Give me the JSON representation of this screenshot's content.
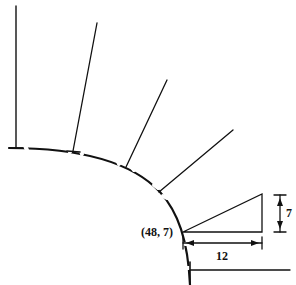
{
  "diagram": {
    "point_label": "(48, 7)",
    "horizontal_dimension": "12",
    "vertical_dimension": "7",
    "colors": {
      "stroke": "#111111",
      "background": "#ffffff"
    }
  }
}
